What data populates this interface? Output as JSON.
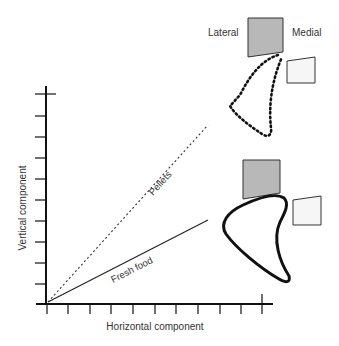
{
  "figure": {
    "labels": {
      "lateral": "Lateral",
      "medial": "Medial",
      "y_axis": "Vertical component",
      "x_axis": "Horizontal component",
      "pellets": "Pellets",
      "fresh_food": "Fresh food"
    },
    "colors": {
      "axis": "#111111",
      "lateral_block_fill": "#b8b8b8",
      "medial_block_fill": "#f6f6f6",
      "line": "#222222",
      "text": "#333333"
    },
    "axes": {
      "x_tick_count": 11,
      "y_tick_count": 10
    },
    "vectors": [
      {
        "name": "Pellets",
        "style": "dotted"
      },
      {
        "name": "Fresh food",
        "style": "solid"
      }
    ],
    "shapes": [
      {
        "name": "pellets-trajectory",
        "style": "dotted outline"
      },
      {
        "name": "fresh-food-trajectory",
        "style": "bold solid outline"
      }
    ]
  }
}
